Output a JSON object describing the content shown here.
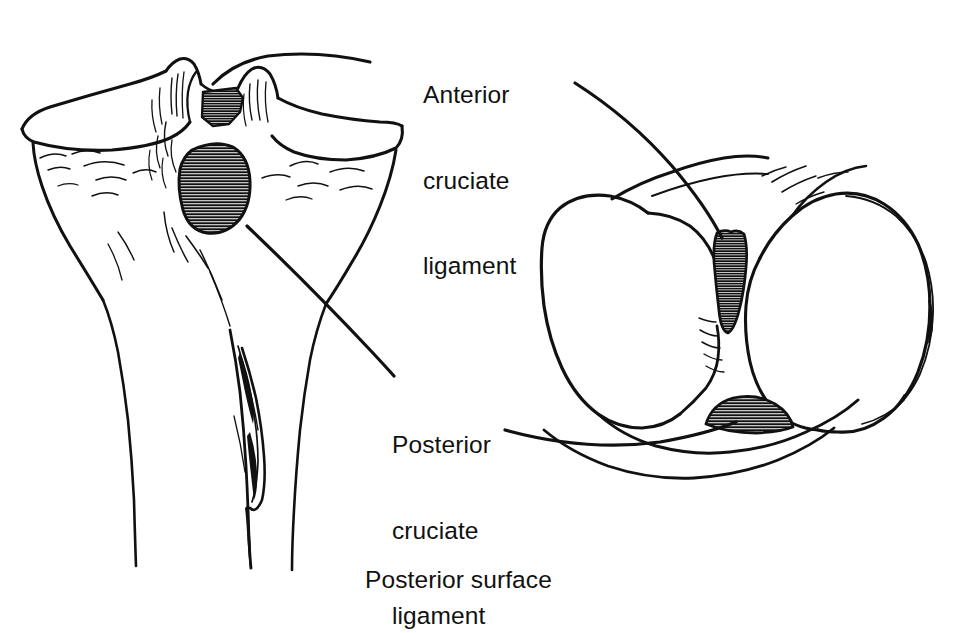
{
  "figure": {
    "background_color": "#ffffff",
    "ink_color": "#111111",
    "width": 958,
    "height": 574
  },
  "labels": {
    "acl": {
      "name": "anterior-cruciate-ligament-label",
      "line1": "Anterior",
      "line2": "cruciate",
      "line3": "ligament",
      "full_text": "Anterior cruciate ligament"
    },
    "pcl": {
      "name": "posterior-cruciate-ligament-label",
      "line1": "Posterior",
      "line2": "cruciate",
      "line3": "ligament",
      "full_text": "Posterior cruciate ligament"
    },
    "posterior_surface": {
      "name": "posterior-surface-label",
      "text": "Posterior surface"
    }
  },
  "illustrations": [
    {
      "id": "tibia-posterior-view",
      "name": "tibial-plateau-posterior-view",
      "description": "Proximal tibia seen from behind, showing intercondylar attachment areas",
      "attachments": [
        {
          "name": "acl-tibial-footprint",
          "hatched": true
        },
        {
          "name": "pcl-tibial-footprint",
          "hatched": true
        }
      ]
    },
    {
      "id": "femur-inferior-view",
      "name": "femoral-condyles-inferior-view",
      "description": "Distal femur seen from below, showing intercondylar notch attachment areas",
      "attachments": [
        {
          "name": "acl-femoral-footprint",
          "hatched": true
        },
        {
          "name": "pcl-femoral-footprint",
          "hatched": true
        }
      ]
    }
  ],
  "leader_lines": [
    {
      "name": "acl-leader-to-tibia",
      "from": "acl-label",
      "to": "acl-tibial-footprint"
    },
    {
      "name": "acl-leader-to-femur",
      "from": "acl-label",
      "to": "acl-femoral-footprint"
    },
    {
      "name": "pcl-leader-to-tibia",
      "from": "pcl-label",
      "to": "pcl-tibial-footprint"
    },
    {
      "name": "pcl-leader-to-femur",
      "from": "pcl-label",
      "to": "pcl-femoral-footprint"
    }
  ]
}
